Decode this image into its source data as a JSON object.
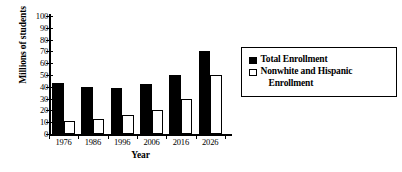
{
  "chart_data": {
    "type": "bar",
    "title": "",
    "xlabel": "Year",
    "ylabel": "Millions of students",
    "categories": [
      "1976",
      "1986",
      "1996",
      "2006",
      "2016",
      "2026"
    ],
    "series": [
      {
        "name": "Total Enrollment",
        "color": "#000000",
        "style": "filled",
        "values": [
          43,
          40,
          39,
          42,
          50,
          70
        ]
      },
      {
        "name": "Nonwhite and Hispanic Enrollment",
        "color": "#ffffff",
        "style": "hollow",
        "values": [
          11,
          12.5,
          16,
          20,
          30,
          50
        ]
      }
    ],
    "ylim": [
      0,
      100
    ],
    "ytick_values": [
      0,
      10,
      20,
      30,
      40,
      50,
      60,
      70,
      80,
      90,
      100
    ],
    "ytick_labels": [
      "0",
      "10",
      "20",
      "30",
      "40",
      "50",
      "60",
      "70",
      "80",
      "90",
      "100"
    ],
    "grid": false,
    "legend_position": "right"
  },
  "legend": {
    "entries": [
      {
        "label": "Total Enrollment",
        "continuation": ""
      },
      {
        "label": "Nonwhite and Hispanic",
        "continuation": "Enrollment"
      }
    ]
  }
}
